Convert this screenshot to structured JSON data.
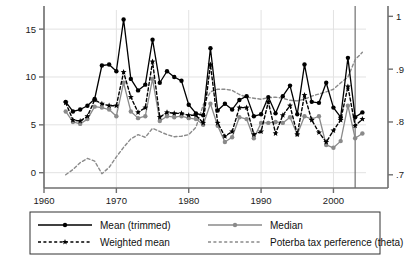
{
  "chart_data": {
    "type": "line",
    "title": "",
    "xlabel": "",
    "ylabel": "",
    "y2label": "Poterba tax preference (theta)",
    "xlim": [
      1960.0,
      2004.5
    ],
    "ylim": [
      -1.6,
      17.0
    ],
    "y2lim": [
      0.675,
      1.012
    ],
    "xticks": [
      1960,
      1970,
      1980,
      1990,
      2000
    ],
    "xticklabels": [
      "1960",
      "1970",
      "1980",
      "1990",
      "2000"
    ],
    "yticks": [
      0,
      5,
      10,
      15
    ],
    "yticklabels": [
      "0",
      "5",
      "10",
      "15"
    ],
    "y2ticks": [
      0.7,
      0.8,
      0.9,
      1.0
    ],
    "y2ticklabels": [
      ".7",
      ".8",
      ".9",
      "1"
    ],
    "grid": true,
    "grid_axis": "both",
    "legend_position": "below",
    "vline": 2003,
    "x": [
      1963,
      1964,
      1965,
      1966,
      1967,
      1968,
      1969,
      1970,
      1971,
      1972,
      1973,
      1974,
      1975,
      1976,
      1977,
      1978,
      1979,
      1980,
      1981,
      1982,
      1983,
      1984,
      1985,
      1986,
      1987,
      1988,
      1989,
      1990,
      1991,
      1992,
      1993,
      1994,
      1995,
      1996,
      1997,
      1998,
      1999,
      2000,
      2001,
      2002,
      2003,
      2004
    ],
    "series": [
      {
        "name": "Mean (trimmed)",
        "color": "#000000",
        "style": "solid",
        "marker": "circle",
        "axis": "left",
        "values": [
          7.4,
          6.4,
          6.6,
          7.0,
          7.7,
          11.2,
          11.3,
          10.6,
          16.0,
          9.8,
          8.6,
          9.2,
          13.9,
          9.4,
          10.6,
          10.0,
          9.6,
          7.1,
          6.2,
          6.0,
          13.0,
          6.5,
          7.2,
          6.6,
          7.6,
          8.0,
          5.9,
          6.1,
          7.9,
          6.2,
          8.0,
          9.1,
          6.1,
          11.3,
          7.4,
          7.3,
          9.4,
          6.8,
          5.8,
          12.0,
          5.8,
          6.3
        ]
      },
      {
        "name": "Weighted mean",
        "color": "#000000",
        "style": "dashed",
        "marker": "star",
        "axis": "left",
        "values": [
          7.3,
          5.5,
          5.4,
          5.9,
          7.6,
          7.2,
          7.0,
          7.0,
          10.5,
          7.9,
          6.3,
          6.8,
          11.6,
          5.8,
          6.3,
          6.2,
          6.2,
          6.0,
          6.0,
          5.2,
          11.3,
          5.2,
          3.8,
          4.3,
          6.8,
          6.8,
          4.0,
          4.3,
          7.4,
          4.1,
          6.0,
          7.0,
          4.0,
          8.1,
          5.5,
          4.2,
          3.2,
          4.4,
          5.5,
          9.0,
          4.9,
          5.6
        ]
      },
      {
        "name": "Median",
        "color": "#8a8a8a",
        "style": "solid",
        "marker": "circle",
        "axis": "left",
        "values": [
          6.4,
          5.3,
          5.1,
          5.6,
          6.9,
          6.8,
          6.6,
          5.9,
          9.4,
          6.4,
          5.7,
          5.9,
          9.8,
          5.4,
          5.9,
          5.8,
          5.9,
          5.7,
          5.6,
          5.0,
          7.2,
          4.9,
          3.2,
          3.7,
          5.8,
          5.6,
          3.6,
          5.2,
          5.2,
          5.3,
          5.2,
          5.8,
          4.0,
          5.9,
          5.6,
          5.9,
          2.9,
          2.6,
          3.3,
          7.0,
          3.6,
          4.1
        ]
      },
      {
        "name": "Poterba tax perference (theta)",
        "color": "#8a8a8a",
        "style": "dashed",
        "marker": "none",
        "axis": "right",
        "values": [
          0.7,
          0.71,
          0.723,
          0.731,
          0.726,
          0.702,
          0.714,
          0.734,
          0.752,
          0.768,
          0.776,
          0.771,
          0.788,
          0.782,
          0.776,
          0.772,
          0.773,
          0.776,
          0.79,
          0.832,
          0.857,
          0.862,
          0.862,
          0.86,
          0.852,
          0.847,
          0.845,
          0.843,
          0.846,
          0.847,
          0.845,
          0.841,
          0.84,
          0.843,
          0.849,
          0.853,
          0.857,
          0.862,
          0.874,
          0.885,
          0.918,
          0.932
        ]
      }
    ]
  },
  "legend": {
    "entries": [
      {
        "label": "Mean (trimmed)",
        "color": "#000000",
        "style": "solid",
        "marker": "circle"
      },
      {
        "label": "Median",
        "color": "#8a8a8a",
        "style": "solid",
        "marker": "circle"
      },
      {
        "label": "Weighted mean",
        "color": "#000000",
        "style": "dashed",
        "marker": "star"
      },
      {
        "label": "Poterba tax perference (theta)",
        "color": "#8a8a8a",
        "style": "dashed",
        "marker": "none"
      }
    ]
  },
  "colors": {
    "black": "#000000",
    "gray": "#8a8a8a",
    "grid": "#e2e2e2",
    "axis": "#6f6f6f",
    "text": "#1a1a1a"
  }
}
